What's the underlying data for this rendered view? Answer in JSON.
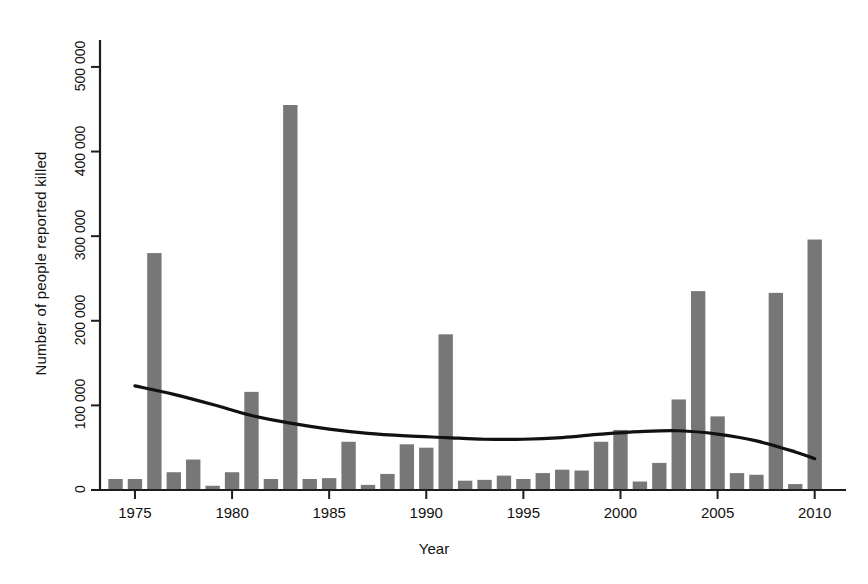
{
  "chart_data": {
    "type": "bar",
    "title": "",
    "subtitle": "",
    "xlabel": "Year",
    "ylabel": "Number of people reported killed",
    "xlim": [
      1973.2,
      2011.2
    ],
    "ylim": [
      0,
      520000
    ],
    "grid": false,
    "legend": null,
    "y_tick_values": [
      0,
      100000,
      200000,
      300000,
      400000,
      500000
    ],
    "y_tick_labels": [
      "0",
      "100 000",
      "200 000",
      "300 000",
      "400 000",
      "500 000"
    ],
    "x_tick_values": [
      1975,
      1980,
      1985,
      1990,
      1995,
      2000,
      2005,
      2010
    ],
    "x_tick_labels": [
      "1975",
      "1980",
      "1985",
      "1990",
      "1995",
      "2000",
      "2005",
      "2010"
    ],
    "categories": [
      1974,
      1975,
      1976,
      1977,
      1978,
      1979,
      1980,
      1981,
      1982,
      1983,
      1984,
      1985,
      1986,
      1987,
      1988,
      1989,
      1990,
      1991,
      1992,
      1993,
      1994,
      1995,
      1996,
      1997,
      1998,
      1999,
      2000,
      2001,
      2002,
      2003,
      2004,
      2005,
      2006,
      2007,
      2008,
      2009,
      2010
    ],
    "values": [
      13000,
      13000,
      280000,
      21000,
      36000,
      5000,
      21000,
      116000,
      13000,
      455000,
      13000,
      14000,
      57000,
      6000,
      19000,
      54000,
      50000,
      184000,
      11000,
      12000,
      17000,
      13000,
      20000,
      24000,
      23000,
      57000,
      71000,
      10000,
      32000,
      107000,
      235000,
      87000,
      20000,
      18000,
      233000,
      7000,
      296000
    ],
    "series": [
      {
        "name": "Number of people reported killed",
        "type": "bar",
        "values": [
          13000,
          13000,
          280000,
          21000,
          36000,
          5000,
          21000,
          116000,
          13000,
          455000,
          13000,
          14000,
          57000,
          6000,
          19000,
          54000,
          50000,
          184000,
          11000,
          12000,
          17000,
          13000,
          20000,
          24000,
          23000,
          57000,
          71000,
          10000,
          32000,
          107000,
          235000,
          87000,
          20000,
          18000,
          233000,
          7000,
          296000
        ],
        "color": "#777779"
      },
      {
        "name": "Smoothed trend",
        "type": "line",
        "x": [
          1975,
          1977,
          1979,
          1981,
          1983,
          1985,
          1987,
          1989,
          1991,
          1993,
          1995,
          1997,
          1999,
          2001,
          2003,
          2005,
          2007,
          2009,
          2010
        ],
        "values": [
          123000,
          113000,
          101000,
          88000,
          79000,
          72000,
          67000,
          64000,
          62000,
          60000,
          60000,
          62000,
          66000,
          69000,
          70000,
          66000,
          58000,
          45000,
          37000
        ],
        "color": "#111111"
      }
    ]
  },
  "axes": {
    "y_title": "Number of people reported killed",
    "x_title": "Year"
  }
}
